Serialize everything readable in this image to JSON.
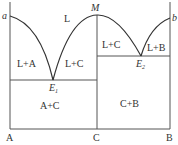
{
  "diagram": {
    "type": "binary phase diagram with congruent compound",
    "corner_labels": {
      "a": "a",
      "b": "b",
      "M": "M"
    },
    "eutectics": {
      "E1": {
        "main": "E",
        "sub": "1"
      },
      "E2": {
        "main": "E",
        "sub": "2"
      }
    },
    "regions": {
      "liquid": "L",
      "l_plus_a": "L+A",
      "l_plus_c_left": "L+C",
      "l_plus_c_right": "L+C",
      "l_plus_b": "L+B",
      "a_plus_c": "A+C",
      "c_plus_b": "C+B"
    },
    "axis_labels": {
      "A": "A",
      "C": "C",
      "B": "B"
    },
    "colors": {
      "line": "#555555",
      "background": "#ffffff"
    }
  }
}
